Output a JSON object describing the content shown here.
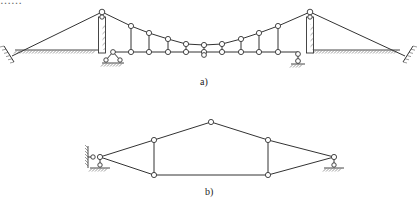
{
  "header_text_clipped": "……",
  "figure": {
    "labels": {
      "a": "a)",
      "b": "b)"
    },
    "colors": {
      "stroke": "#333333",
      "node_fill": "#ffffff",
      "background": "#ffffff"
    }
  },
  "diagram_a": {
    "description": "Suspension bridge kinematic scheme",
    "tower_tops": [
      [
        102,
        12
      ],
      [
        310,
        12
      ]
    ],
    "cable_nodes": [
      [
        131,
        26
      ],
      [
        149,
        33
      ],
      [
        168,
        39
      ],
      [
        186,
        44
      ],
      [
        204,
        45
      ],
      [
        222,
        44
      ],
      [
        241,
        39
      ],
      [
        259,
        33
      ],
      [
        278,
        26
      ]
    ],
    "deck_nodes": [
      [
        131,
        52
      ],
      [
        149,
        52
      ],
      [
        168,
        52
      ],
      [
        186,
        52
      ],
      [
        204,
        52
      ],
      [
        222,
        52
      ],
      [
        241,
        52
      ],
      [
        259,
        52
      ],
      [
        278,
        52
      ]
    ],
    "middle_lower_node": [
      204,
      55
    ],
    "deck_y": 52,
    "deck_start_x": 113,
    "deck_end_x": 298,
    "left_anchor": [
      8,
      52
    ],
    "right_anchor": [
      404,
      52
    ],
    "ground_left": [
      15,
      98
    ],
    "ground_right": [
      314,
      400
    ],
    "ground_y": 50
  },
  "diagram_b": {
    "description": "Combined truss/arch scheme",
    "nodes": {
      "left_support": [
        100,
        157
      ],
      "apex": [
        211,
        122
      ],
      "upper_left": [
        154,
        140
      ],
      "upper_right": [
        268,
        140
      ],
      "lower_left": [
        154,
        175
      ],
      "lower_right": [
        268,
        175
      ],
      "right_support": [
        334,
        157
      ]
    }
  }
}
